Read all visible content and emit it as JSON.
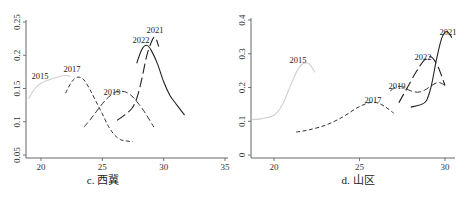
{
  "chart_data": [
    {
      "type": "line",
      "title": "c. 西冀",
      "caption": "c.  西冀",
      "xlabel": "",
      "ylabel": "",
      "xlim": [
        19,
        35
      ],
      "ylim": [
        0.05,
        0.25
      ],
      "x_ticks": [
        "20",
        "25",
        "30",
        "35"
      ],
      "y_ticks": [
        "0.05",
        "0.1",
        "0.15",
        "0.2",
        "0.25"
      ],
      "grid": false,
      "legend": "inline annotations",
      "series": [
        {
          "name": "2015",
          "style": "solid-light",
          "x": [
            19.0,
            19.5,
            20.0,
            20.5,
            21.0,
            21.5,
            22.0,
            22.4
          ],
          "values": [
            0.135,
            0.15,
            0.158,
            0.162,
            0.165,
            0.168,
            0.17,
            0.168
          ]
        },
        {
          "name": "2017",
          "style": "short-dash",
          "x": [
            22.0,
            22.5,
            23.0,
            23.5,
            24.0,
            24.5,
            25.0,
            25.5,
            26.0,
            26.5,
            27.0,
            27.5
          ],
          "values": [
            0.143,
            0.16,
            0.167,
            0.163,
            0.148,
            0.13,
            0.112,
            0.093,
            0.08,
            0.073,
            0.071,
            0.07
          ]
        },
        {
          "name": "2019",
          "style": "dash",
          "x": [
            23.5,
            24.0,
            24.5,
            25.0,
            25.5,
            26.0,
            26.5,
            27.0,
            27.5,
            28.0,
            28.5,
            29.2
          ],
          "values": [
            0.092,
            0.103,
            0.115,
            0.127,
            0.137,
            0.144,
            0.146,
            0.144,
            0.137,
            0.126,
            0.113,
            0.092
          ]
        },
        {
          "name": "2021",
          "style": "long-dash",
          "x": [
            26.2,
            26.8,
            27.4,
            27.8,
            28.2,
            28.6,
            29.0,
            29.3,
            29.6
          ],
          "values": [
            0.102,
            0.11,
            0.12,
            0.135,
            0.163,
            0.198,
            0.22,
            0.227,
            0.213
          ]
        },
        {
          "name": "2022",
          "style": "solid-dark",
          "x": [
            27.8,
            28.2,
            28.6,
            29.0,
            29.5,
            30.0,
            30.5,
            31.0,
            31.7
          ],
          "values": [
            0.188,
            0.208,
            0.215,
            0.207,
            0.187,
            0.16,
            0.14,
            0.127,
            0.11
          ]
        }
      ]
    },
    {
      "type": "line",
      "title": "d. 山区",
      "caption": "d.  山区",
      "xlabel": "",
      "ylabel": "",
      "xlim": [
        18.7,
        30.5
      ],
      "ylim": [
        0,
        0.4
      ],
      "x_ticks": [
        "20",
        "25",
        "30"
      ],
      "y_ticks": [
        "0",
        "0.1",
        "0.2",
        "0.3",
        "0.4"
      ],
      "grid": false,
      "legend": "inline annotations",
      "series": [
        {
          "name": "2015",
          "style": "solid-light",
          "x": [
            18.7,
            19.3,
            20.0,
            20.5,
            21.0,
            21.5,
            22.0,
            22.4
          ],
          "values": [
            0.105,
            0.108,
            0.118,
            0.15,
            0.21,
            0.262,
            0.272,
            0.245
          ]
        },
        {
          "name": "2017",
          "style": "short-dash",
          "x": [
            21.3,
            22.0,
            23.0,
            24.0,
            24.8,
            25.5,
            26.0,
            26.5,
            27.0
          ],
          "values": [
            0.068,
            0.074,
            0.088,
            0.112,
            0.138,
            0.154,
            0.155,
            0.143,
            0.124
          ]
        },
        {
          "name": "2019",
          "style": "dash",
          "x": [
            26.8,
            27.2,
            27.6,
            28.0,
            28.4,
            28.8,
            29.2,
            29.6,
            30.0
          ],
          "values": [
            0.19,
            0.203,
            0.2,
            0.19,
            0.186,
            0.192,
            0.205,
            0.215,
            0.207
          ]
        },
        {
          "name": "2021",
          "style": "solid-dark",
          "x": [
            28.0,
            28.5,
            28.9,
            29.2,
            29.5,
            29.8,
            30.1,
            30.4
          ],
          "values": [
            0.142,
            0.148,
            0.16,
            0.205,
            0.282,
            0.345,
            0.366,
            0.348
          ]
        },
        {
          "name": "2022",
          "style": "long-dash",
          "x": [
            27.3,
            27.8,
            28.3,
            28.8,
            29.2,
            29.6,
            30.0
          ],
          "values": [
            0.155,
            0.2,
            0.245,
            0.282,
            0.29,
            0.26,
            0.206
          ]
        }
      ]
    }
  ],
  "panels": [
    {
      "caption": "c.  西冀",
      "annotations": [
        "2015",
        "2017",
        "2019",
        "2022",
        "2021"
      ]
    },
    {
      "caption": "d.  山区",
      "annotations": [
        "2015",
        "2017",
        "2019",
        "2022",
        "2021"
      ]
    }
  ]
}
